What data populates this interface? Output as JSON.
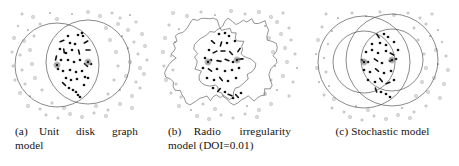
{
  "figure": {
    "background": "#ffffff",
    "ink": "#1a1a1a",
    "outline_color": "#4a4a4a",
    "node_outside_color": "#8a8a8a",
    "node_inside_color": "#121212"
  },
  "panels": [
    {
      "id": "panel-a",
      "label": "(a)",
      "caption_line1": "(a)  Unit   disk   graph",
      "caption_line2": "model",
      "caption_full": "(a) Unit disk graph model",
      "model_name": "Unit disk graph model",
      "shape_type": "circle",
      "align": "justify"
    },
    {
      "id": "panel-b",
      "label": "(b)",
      "caption_line1": "(b)  Radio   irregularity",
      "caption_line2": "model (DOI=0.01)",
      "caption_full": "(b) Radio irregularity model (DOI=0.01)",
      "model_name": "Radio irregularity model",
      "parameter_label": "DOI",
      "parameter_value": "0.01",
      "shape_type": "irregular-polygon",
      "align": "justify"
    },
    {
      "id": "panel-c",
      "label": "(c)",
      "caption_line1": "(c) Stochastic model",
      "caption_line2": "",
      "caption_full": "(c) Stochastic model",
      "model_name": "Stochastic model",
      "shape_type": "concentric-circles",
      "align": "center"
    }
  ],
  "chart_data": {
    "type": "scatter",
    "title": "",
    "xlabel": "",
    "ylabel": "",
    "grid": false,
    "legend": "none",
    "xlim": [
      0,
      153
    ],
    "ylim": [
      0,
      124
    ],
    "panels": [
      {
        "name": "Unit disk graph model",
        "centers": [
          {
            "x": 57,
            "y": 65
          },
          {
            "x": 88,
            "y": 62
          }
        ],
        "coverage": [
          {
            "cx": 57,
            "cy": 65,
            "r": 42
          },
          {
            "cx": 88,
            "cy": 62,
            "r": 42
          }
        ],
        "inside_nodes": [
          [
            68,
            36
          ],
          [
            78,
            35
          ],
          [
            82,
            33
          ],
          [
            83,
            36
          ],
          [
            62,
            41
          ],
          [
            70,
            43
          ],
          [
            75,
            44
          ],
          [
            86,
            42
          ],
          [
            60,
            49
          ],
          [
            64,
            51
          ],
          [
            66,
            53
          ],
          [
            72,
            50
          ],
          [
            79,
            52
          ],
          [
            88,
            50
          ],
          [
            56,
            58
          ],
          [
            61,
            60
          ],
          [
            68,
            60
          ],
          [
            74,
            62
          ],
          [
            80,
            60
          ],
          [
            86,
            65
          ],
          [
            91,
            64
          ],
          [
            58,
            69
          ],
          [
            63,
            71
          ],
          [
            70,
            70
          ],
          [
            76,
            72
          ],
          [
            82,
            71
          ],
          [
            66,
            78
          ],
          [
            71,
            80
          ],
          [
            77,
            79
          ],
          [
            85,
            77
          ],
          [
            88,
            78
          ],
          [
            69,
            88
          ],
          [
            73,
            90
          ],
          [
            76,
            92
          ],
          [
            78,
            95
          ],
          [
            80,
            97
          ],
          [
            64,
            84
          ],
          [
            84,
            85
          ]
        ],
        "outside_nodes": [
          [
            22,
            14
          ],
          [
            33,
            17
          ],
          [
            50,
            13
          ],
          [
            57,
            19
          ],
          [
            72,
            14
          ],
          [
            88,
            12
          ],
          [
            100,
            16
          ],
          [
            112,
            13
          ],
          [
            120,
            18
          ],
          [
            130,
            15
          ],
          [
            18,
            26
          ],
          [
            28,
            30
          ],
          [
            40,
            24
          ],
          [
            106,
            28
          ],
          [
            118,
            24
          ],
          [
            128,
            30
          ],
          [
            136,
            22
          ],
          [
            14,
            38
          ],
          [
            24,
            41
          ],
          [
            34,
            36
          ],
          [
            110,
            40
          ],
          [
            122,
            36
          ],
          [
            134,
            42
          ],
          [
            142,
            34
          ],
          [
            12,
            52
          ],
          [
            20,
            55
          ],
          [
            30,
            50
          ],
          [
            116,
            52
          ],
          [
            128,
            48
          ],
          [
            138,
            54
          ],
          [
            145,
            46
          ],
          [
            13,
            66
          ],
          [
            22,
            70
          ],
          [
            32,
            64
          ],
          [
            118,
            66
          ],
          [
            130,
            62
          ],
          [
            140,
            68
          ],
          [
            147,
            60
          ],
          [
            15,
            80
          ],
          [
            25,
            84
          ],
          [
            35,
            78
          ],
          [
            114,
            80
          ],
          [
            126,
            76
          ],
          [
            136,
            82
          ],
          [
            144,
            74
          ],
          [
            20,
            93
          ],
          [
            30,
            96
          ],
          [
            42,
            90
          ],
          [
            108,
            94
          ],
          [
            120,
            90
          ],
          [
            132,
            96
          ],
          [
            140,
            88
          ],
          [
            28,
            106
          ],
          [
            40,
            109
          ],
          [
            52,
            103
          ],
          [
            64,
            108
          ],
          [
            96,
            106
          ],
          [
            108,
            110
          ],
          [
            120,
            104
          ],
          [
            132,
            108
          ],
          [
            46,
            115
          ],
          [
            58,
            118
          ],
          [
            70,
            114
          ],
          [
            82,
            117
          ],
          [
            94,
            113
          ],
          [
            106,
            116
          ]
        ]
      },
      {
        "name": "Radio irregularity model (DOI=0.01)",
        "centers": [
          {
            "x": 55,
            "y": 62
          },
          {
            "x": 84,
            "y": 60
          }
        ],
        "coverage": [
          {
            "cx": 55,
            "cy": 62,
            "r": 40,
            "irregular": true
          },
          {
            "cx": 84,
            "cy": 60,
            "r": 40,
            "irregular": true
          }
        ],
        "inside_nodes": [
          [
            66,
            34
          ],
          [
            72,
            33
          ],
          [
            76,
            36
          ],
          [
            60,
            42
          ],
          [
            68,
            44
          ],
          [
            74,
            43
          ],
          [
            82,
            41
          ],
          [
            56,
            50
          ],
          [
            62,
            52
          ],
          [
            70,
            51
          ],
          [
            78,
            53
          ],
          [
            86,
            50
          ],
          [
            52,
            58
          ],
          [
            58,
            60
          ],
          [
            66,
            61
          ],
          [
            74,
            60
          ],
          [
            80,
            62
          ],
          [
            88,
            59
          ],
          [
            50,
            68
          ],
          [
            57,
            70
          ],
          [
            64,
            69
          ],
          [
            72,
            71
          ],
          [
            79,
            70
          ],
          [
            86,
            68
          ],
          [
            54,
            78
          ],
          [
            61,
            80
          ],
          [
            68,
            79
          ],
          [
            75,
            81
          ],
          [
            83,
            78
          ],
          [
            60,
            88
          ],
          [
            66,
            90
          ],
          [
            72,
            92
          ],
          [
            77,
            95
          ],
          [
            80,
            98
          ],
          [
            84,
            96
          ],
          [
            88,
            93
          ]
        ],
        "outside_nodes": [
          [
            20,
            13
          ],
          [
            34,
            16
          ],
          [
            48,
            12
          ],
          [
            62,
            15
          ],
          [
            78,
            11
          ],
          [
            92,
            14
          ],
          [
            106,
            12
          ],
          [
            118,
            17
          ],
          [
            130,
            13
          ],
          [
            16,
            25
          ],
          [
            26,
            29
          ],
          [
            112,
            26
          ],
          [
            124,
            22
          ],
          [
            136,
            28
          ],
          [
            12,
            38
          ],
          [
            22,
            42
          ],
          [
            116,
            38
          ],
          [
            128,
            34
          ],
          [
            138,
            40
          ],
          [
            10,
            52
          ],
          [
            18,
            56
          ],
          [
            120,
            52
          ],
          [
            132,
            48
          ],
          [
            142,
            54
          ],
          [
            11,
            66
          ],
          [
            20,
            70
          ],
          [
            122,
            66
          ],
          [
            134,
            62
          ],
          [
            144,
            68
          ],
          [
            13,
            80
          ],
          [
            23,
            84
          ],
          [
            118,
            80
          ],
          [
            130,
            76
          ],
          [
            140,
            82
          ],
          [
            18,
            93
          ],
          [
            28,
            97
          ],
          [
            112,
            94
          ],
          [
            124,
            90
          ],
          [
            136,
            96
          ],
          [
            26,
            106
          ],
          [
            38,
            110
          ],
          [
            50,
            104
          ],
          [
            62,
            109
          ],
          [
            94,
            106
          ],
          [
            106,
            110
          ],
          [
            118,
            104
          ],
          [
            44,
            116
          ],
          [
            56,
            119
          ],
          [
            68,
            115
          ],
          [
            80,
            118
          ],
          [
            92,
            114
          ],
          [
            104,
            117
          ]
        ]
      },
      {
        "name": "Stochastic model",
        "centers": [
          {
            "x": 58,
            "y": 62
          },
          {
            "x": 86,
            "y": 60
          }
        ],
        "coverage": [
          {
            "cx": 58,
            "cy": 62,
            "r": 46
          },
          {
            "cx": 58,
            "cy": 62,
            "r": 31
          },
          {
            "cx": 86,
            "cy": 60,
            "r": 46
          },
          {
            "cx": 86,
            "cy": 60,
            "r": 31
          }
        ],
        "inside_nodes": [
          [
            72,
            36
          ],
          [
            78,
            34
          ],
          [
            82,
            37
          ],
          [
            66,
            44
          ],
          [
            74,
            43
          ],
          [
            80,
            45
          ],
          [
            88,
            42
          ],
          [
            60,
            52
          ],
          [
            66,
            50
          ],
          [
            72,
            53
          ],
          [
            80,
            51
          ],
          [
            86,
            54
          ],
          [
            92,
            50
          ],
          [
            56,
            60
          ],
          [
            62,
            62
          ],
          [
            70,
            60
          ],
          [
            76,
            63
          ],
          [
            84,
            61
          ],
          [
            90,
            59
          ],
          [
            58,
            70
          ],
          [
            64,
            72
          ],
          [
            71,
            70
          ],
          [
            78,
            73
          ],
          [
            85,
            71
          ],
          [
            62,
            80
          ],
          [
            69,
            82
          ],
          [
            75,
            80
          ],
          [
            82,
            83
          ],
          [
            88,
            80
          ],
          [
            70,
            90
          ],
          [
            75,
            92
          ],
          [
            80,
            94
          ],
          [
            84,
            97
          ]
        ],
        "outside_nodes": [
          [
            20,
            14
          ],
          [
            32,
            18
          ],
          [
            46,
            13
          ],
          [
            60,
            16
          ],
          [
            74,
            12
          ],
          [
            88,
            15
          ],
          [
            102,
            13
          ],
          [
            114,
            18
          ],
          [
            126,
            14
          ],
          [
            16,
            27
          ],
          [
            26,
            31
          ],
          [
            108,
            28
          ],
          [
            120,
            24
          ],
          [
            132,
            30
          ],
          [
            12,
            40
          ],
          [
            22,
            44
          ],
          [
            112,
            40
          ],
          [
            124,
            36
          ],
          [
            136,
            42
          ],
          [
            10,
            54
          ],
          [
            18,
            58
          ],
          [
            118,
            54
          ],
          [
            130,
            50
          ],
          [
            140,
            56
          ],
          [
            11,
            68
          ],
          [
            20,
            72
          ],
          [
            120,
            68
          ],
          [
            132,
            64
          ],
          [
            142,
            70
          ],
          [
            13,
            82
          ],
          [
            23,
            86
          ],
          [
            116,
            82
          ],
          [
            128,
            78
          ],
          [
            138,
            84
          ],
          [
            18,
            95
          ],
          [
            28,
            99
          ],
          [
            110,
            96
          ],
          [
            122,
            92
          ],
          [
            134,
            98
          ],
          [
            26,
            108
          ],
          [
            38,
            112
          ],
          [
            50,
            106
          ],
          [
            62,
            110
          ],
          [
            96,
            108
          ],
          [
            108,
            112
          ],
          [
            120,
            106
          ],
          [
            44,
            117
          ],
          [
            56,
            120
          ],
          [
            68,
            116
          ],
          [
            80,
            119
          ],
          [
            92,
            115
          ],
          [
            104,
            118
          ]
        ]
      }
    ]
  }
}
